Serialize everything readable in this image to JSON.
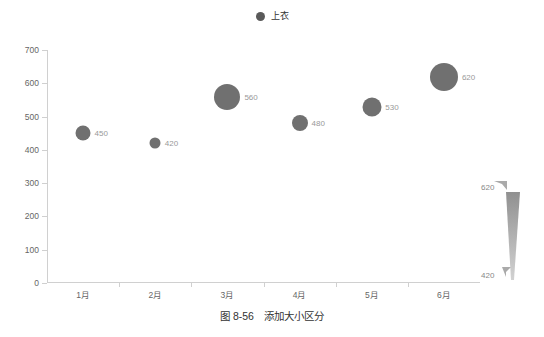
{
  "legend": {
    "marker_icon": "filled-circle-icon",
    "items": [
      {
        "label": "上衣",
        "color": "#5a5a5a"
      }
    ]
  },
  "chart_data": {
    "type": "scatter",
    "title": "",
    "subtitle": "",
    "xlabel": "",
    "ylabel": "",
    "categories": [
      "1月",
      "2月",
      "3月",
      "4月",
      "5月",
      "6月"
    ],
    "values": [
      450,
      420,
      560,
      480,
      530,
      620
    ],
    "series": [
      {
        "name": "上衣",
        "color": "#707070",
        "values": [
          450,
          420,
          560,
          480,
          530,
          620
        ],
        "symbol_sizes": [
          15,
          11,
          26,
          16,
          19,
          28
        ],
        "point_labels": [
          "450",
          "420",
          "560",
          "480",
          "530",
          "620"
        ]
      }
    ],
    "ylim": [
      0,
      700
    ],
    "yticks": [
      0,
      100,
      200,
      300,
      400,
      500,
      600,
      700
    ],
    "ytick_labels": [
      "0",
      "100",
      "200",
      "300",
      "400",
      "500",
      "600",
      "700"
    ],
    "grid": false,
    "legend_position": "top-center",
    "axis_color": "#d0d0d0",
    "label_color": "#666666",
    "point_label_color": "#999999"
  },
  "visual_map": {
    "name": "size-visual-map",
    "max_label": "620",
    "min_label": "420",
    "max_value": 620,
    "min_value": 420,
    "orientation": "vertical",
    "color_top": "#909090",
    "color_bottom": "#cfcfcf"
  },
  "caption": {
    "text": "图 8-56　添加大小区分"
  }
}
